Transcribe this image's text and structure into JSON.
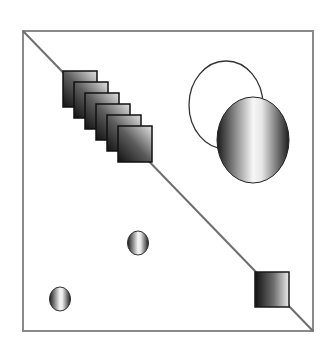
{
  "figure": {
    "colors": {
      "frame": "#8a8a8a",
      "diagonal": "#6e6e6e",
      "shape_stroke": "#1a1a1a",
      "gradient_dark": "#111111",
      "gradient_mid": "#7a7a7a",
      "gradient_light": "#f4f4f4",
      "background": "#ffffff"
    },
    "cascade_square_count": 6
  }
}
